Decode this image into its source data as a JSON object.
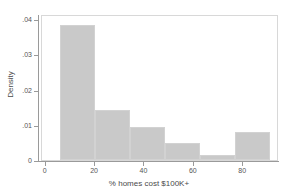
{
  "chart_data": {
    "type": "bar",
    "title": "",
    "subtitle": "",
    "xlabel": "% homes cost $100K+",
    "ylabel": "Density",
    "xlim": [
      -1.5,
      94.5
    ],
    "ylim": [
      0,
      0.0415
    ],
    "grid": false,
    "legend": null,
    "bin_width": 14.2,
    "categories": [
      "5.6-19.8",
      "19.8-34.0",
      "34.0-48.2",
      "48.2-62.4",
      "62.4-76.6",
      "76.6-90.8"
    ],
    "bin_edges": [
      5.6,
      19.8,
      34.0,
      48.2,
      62.4,
      76.6,
      90.8
    ],
    "values": [
      0.0385,
      0.0143,
      0.0094,
      0.0049,
      0.0013,
      0.0081
    ],
    "xticks": [
      0,
      20,
      40,
      60,
      80
    ],
    "xtick_labels": [
      "0",
      "20",
      "40",
      "60",
      "80"
    ],
    "yticks": [
      0,
      0.01,
      0.02,
      0.03,
      0.04
    ],
    "ytick_labels": [
      "0",
      ".01",
      ".02",
      ".03",
      ".04"
    ],
    "bar_color": "#c9c9c9",
    "bar_edge_color": "#d2d2d2",
    "axis_color": "#9a9a9a",
    "frame_color": "#d8d8d8",
    "text_color": "#4a4a4a",
    "background": "#ffffff"
  }
}
